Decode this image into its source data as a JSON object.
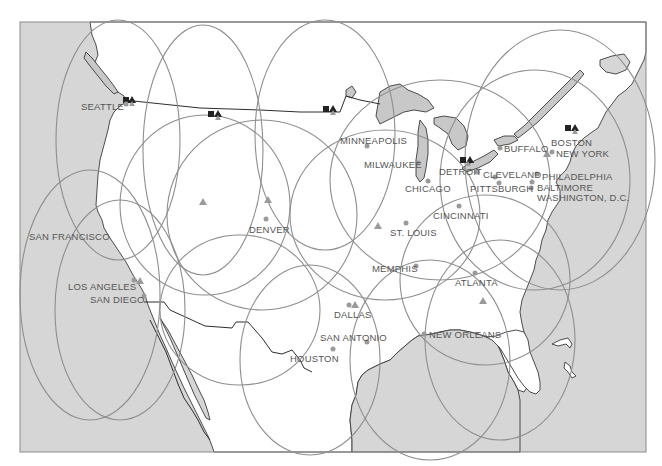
{
  "map": {
    "title": "",
    "colors": {
      "water": "#d6d6d6",
      "land": "#ffffff",
      "lakes": "#c8c8c8",
      "coverage_lines": "#8e8e8e",
      "city_markers": "#9a9a9a",
      "station_markers": "#222222",
      "labels": "#555555"
    },
    "cities": [
      {
        "name": "SEATTLE",
        "label": "SEATTLE"
      },
      {
        "name": "MINNEAPOLIS",
        "label": "MINNEAPOLIS"
      },
      {
        "name": "MILWAUKEE",
        "label": "MILWAUKEE"
      },
      {
        "name": "CHICAGO",
        "label": "CHICAGO"
      },
      {
        "name": "DETROIT",
        "label": "DETROIT"
      },
      {
        "name": "CLEVELAND",
        "label": "CLEVELAND"
      },
      {
        "name": "PITTSBURGH",
        "label": "PITTSBURGH"
      },
      {
        "name": "BUFFALO",
        "label": "BUFFALO"
      },
      {
        "name": "BOSTON",
        "label": "BOSTON"
      },
      {
        "name": "NEW YORK",
        "label": "NEW YORK"
      },
      {
        "name": "PHILADELPHIA",
        "label": "PHILADELPHIA"
      },
      {
        "name": "BALTIMORE",
        "label": "BALTIMORE"
      },
      {
        "name": "WASHINGTON, D.C.",
        "label": "WASHINGTON, D.C."
      },
      {
        "name": "CINCINNATI",
        "label": "CINCINNATI"
      },
      {
        "name": "ST. LOUIS",
        "label": "ST. LOUIS"
      },
      {
        "name": "DENVER",
        "label": "DENVER"
      },
      {
        "name": "SAN FRANCISCO",
        "label": "SAN FRANCISCO"
      },
      {
        "name": "LOS ANGELES",
        "label": "LOS ANGELES"
      },
      {
        "name": "SAN DIEGO",
        "label": "SAN DIEGO"
      },
      {
        "name": "MEMPHIS",
        "label": "MEMPHIS"
      },
      {
        "name": "ATLANTA",
        "label": "ATLANTA"
      },
      {
        "name": "DALLAS",
        "label": "DALLAS"
      },
      {
        "name": "SAN ANTONIO",
        "label": "SAN ANTONIO"
      },
      {
        "name": "HOUSTON",
        "label": "HOUSTON"
      },
      {
        "name": "NEW ORLEANS",
        "label": "NEW ORLEANS"
      }
    ],
    "legend_symbols": {
      "city_marker": "grey-dot",
      "station_marker": "black-triangle",
      "square_marker": "black-square",
      "relay_marker": "grey-triangle"
    }
  }
}
